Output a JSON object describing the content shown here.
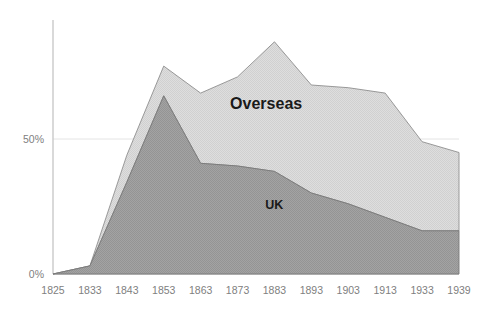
{
  "chart_data": {
    "type": "area",
    "stacked": true,
    "title": "",
    "subtitle": "",
    "xlabel": "",
    "ylabel": "",
    "categories": [
      "1825",
      "1833",
      "1843",
      "1853",
      "1863",
      "1873",
      "1883",
      "1893",
      "1903",
      "1913",
      "1933",
      "1939"
    ],
    "series": [
      {
        "name": "UK",
        "color": "#9a9a9a",
        "values": [
          0,
          3,
          34,
          66,
          41,
          40,
          38,
          30,
          26,
          21,
          16,
          16
        ]
      },
      {
        "name": "Overseas",
        "color": "#d9d9d9",
        "values": [
          0,
          0,
          10,
          11,
          26,
          33,
          48,
          40,
          43,
          46,
          33,
          29
        ]
      }
    ],
    "totals": [
      0,
      3,
      44,
      77,
      67,
      73,
      86,
      70,
      69,
      67,
      49,
      45
    ],
    "ylim": [
      0,
      94
    ],
    "yticks": [
      0,
      50
    ],
    "ytick_labels": [
      "0%",
      "50%"
    ],
    "grid": true,
    "gridlines_y": [
      50
    ],
    "legend_position": "inline-annotations",
    "annotations": [
      {
        "text": "Overseas",
        "series": "Overseas",
        "x_pct": 0.525,
        "y_value": 61
      },
      {
        "text": "UK",
        "series": "UK",
        "x_pct": 0.545,
        "y_value": 24
      }
    ]
  },
  "axis": {
    "y_tick_0": "0%",
    "y_tick_50": "50%"
  },
  "labels": {
    "overseas": "Overseas",
    "uk": "UK"
  }
}
